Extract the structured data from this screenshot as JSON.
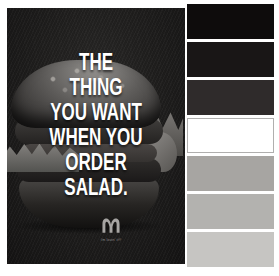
{
  "ad": {
    "headline_lines": [
      "THE",
      "THING",
      "YOU WANT",
      "WHEN YOU",
      "ORDER",
      "SALAD."
    ],
    "tagline": "i'm lovin' it®",
    "colors": {
      "background": "#1f1e1e",
      "headline": "#ffffff",
      "logo": "#a6a4a2"
    }
  },
  "palette": {
    "swatches": [
      {
        "name": "swatch-1",
        "color": "#0e0c0c"
      },
      {
        "name": "swatch-2",
        "color": "#191616"
      },
      {
        "name": "swatch-3",
        "color": "#2f2b2b"
      },
      {
        "name": "swatch-4",
        "color": "#ffffff"
      },
      {
        "name": "swatch-5",
        "color": "#a7a5a2"
      },
      {
        "name": "swatch-6",
        "color": "#b3b2af"
      },
      {
        "name": "swatch-7",
        "color": "#c6c5c2"
      }
    ]
  }
}
